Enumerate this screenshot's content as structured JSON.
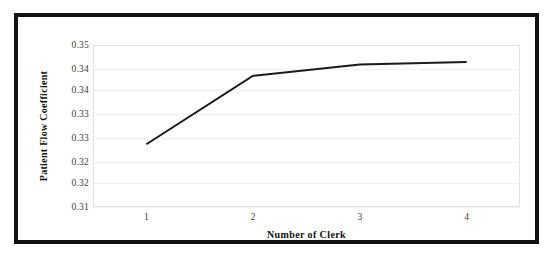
{
  "chart_data": {
    "type": "line",
    "title": "",
    "subtitle": "",
    "xlabel": "Number of Clerk",
    "ylabel": "Patient Flow Coefficient",
    "x": [
      1,
      2,
      3,
      4
    ],
    "categories": [
      "1",
      "2",
      "3",
      "4"
    ],
    "values": [
      0.3255,
      0.3424,
      0.3452,
      0.3458
    ],
    "series": [
      {
        "name": "Patient Flow Coefficient",
        "values": [
          0.3255,
          0.3424,
          0.3452,
          0.3458
        ],
        "color": "#1a1a1a"
      }
    ],
    "x_tick_labels": [
      "1",
      "2",
      "3",
      "4"
    ],
    "y_tick_labels": [
      "0.35",
      "0.34",
      "0.34",
      "0.33",
      "0.33",
      "0.32",
      "0.32",
      "0.31"
    ],
    "y_tick_values": [
      0.35,
      0.344,
      0.339,
      0.333,
      0.327,
      0.321,
      0.316,
      0.31
    ],
    "ylim": [
      0.31,
      0.35
    ],
    "xlim": [
      0.5,
      4.5
    ],
    "grid": true,
    "grid_color": "#f2f2f2",
    "legend": "none",
    "line_color": "#1a1a1a",
    "line_width": 2,
    "markers": "none",
    "plot_background": "#ffffff",
    "border_color": "#e2e2e2",
    "frame_color": "#111111"
  },
  "figure": {
    "frame_label": "figure-border",
    "background": "#ffffff"
  }
}
